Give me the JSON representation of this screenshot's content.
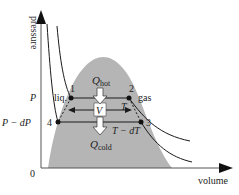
{
  "diagram": {
    "axes": {
      "y_label": "pressure",
      "x_label": "volume",
      "origin_label": "0"
    },
    "pressure_labels": {
      "high": "P",
      "low": "P − dP"
    },
    "points": [
      {
        "id": "1",
        "label": "1"
      },
      {
        "id": "2",
        "label": "2"
      },
      {
        "id": "3",
        "label": "3"
      },
      {
        "id": "4",
        "label": "4"
      }
    ],
    "phase_labels": {
      "liquid": "liq.",
      "gas": "gas"
    },
    "temperature_labels": {
      "hot": "T",
      "cold": "T − dT"
    },
    "heat_labels": {
      "hot_main": "Q",
      "hot_sub": "hot",
      "cold_main": "Q",
      "cold_sub": "cold"
    },
    "volume_label": "V",
    "colors": {
      "dome": "#b5b5b5",
      "lines": "#1a1a1a",
      "axes": "#555555"
    }
  }
}
